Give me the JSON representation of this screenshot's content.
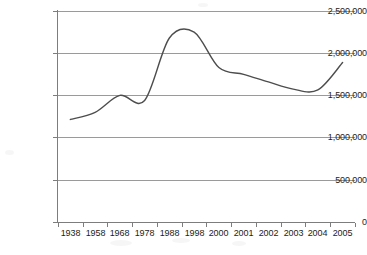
{
  "chart_data": {
    "type": "line",
    "title": "",
    "subtitle": "",
    "xlabel": "",
    "ylabel": "",
    "categories": [
      "1938",
      "1958",
      "1968",
      "1978",
      "1988",
      "1998",
      "2000",
      "2001",
      "2002",
      "2003",
      "2004",
      "2005"
    ],
    "values": [
      1215000,
      1300000,
      1500000,
      1440000,
      2180000,
      2250000,
      1830000,
      1750000,
      1660000,
      1575000,
      1565000,
      1890000
    ],
    "series": [
      {
        "name": "",
        "values": [
          1215000,
          1300000,
          1500000,
          1440000,
          2180000,
          2250000,
          1830000,
          1750000,
          1660000,
          1575000,
          1565000,
          1890000
        ]
      }
    ],
    "ylim": [
      0,
      2500000
    ],
    "ytick_values": [
      0,
      500000,
      1000000,
      1500000,
      2000000,
      2500000
    ],
    "ytick_labels": [
      "0",
      "500,000",
      "1,000,000",
      "1,500,000",
      "2,000,000",
      "2,500,000"
    ],
    "grid": true,
    "grid_axis": "y",
    "legend": false,
    "legend_position": "none",
    "annotations": [],
    "peak_value": 2345000,
    "minimum_value": 1555000,
    "line_color": "#4d4d4d",
    "grid_color": "#9a9a9a",
    "axis_color": "#7d7d7d",
    "background_color": "#ffffff"
  },
  "axes": {
    "y_ticks": [
      {
        "label": "2,500,000",
        "value": 2500000
      },
      {
        "label": "2,000,000",
        "value": 2000000
      },
      {
        "label": "1,500,000",
        "value": 1500000
      },
      {
        "label": "1,000,000",
        "value": 1000000
      },
      {
        "label": "500,000",
        "value": 500000
      },
      {
        "label": "0",
        "value": 0
      }
    ],
    "x_ticks": [
      {
        "label": "1938"
      },
      {
        "label": "1958"
      },
      {
        "label": "1968"
      },
      {
        "label": "1978"
      },
      {
        "label": "1988"
      },
      {
        "label": "1998"
      },
      {
        "label": "2000"
      },
      {
        "label": "2001"
      },
      {
        "label": "2002"
      },
      {
        "label": "2003"
      },
      {
        "label": "2004"
      },
      {
        "label": "2005"
      }
    ]
  }
}
